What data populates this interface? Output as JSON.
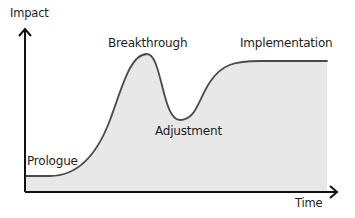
{
  "diagram": {
    "type": "curve",
    "y_axis_label": "Impact",
    "x_axis_label": "Time",
    "stages": [
      {
        "label": "Prologue",
        "description": "low flat start"
      },
      {
        "label": "Breakthrough",
        "description": "sharp peak"
      },
      {
        "label": "Adjustment",
        "description": "dip / valley"
      },
      {
        "label": "Implementation",
        "description": "stable plateau"
      }
    ],
    "colors": {
      "curve_stroke": "#4a4a4a",
      "area_fill": "#e8e8e8",
      "axis": "#111111",
      "text": "#1e1e1e"
    }
  }
}
